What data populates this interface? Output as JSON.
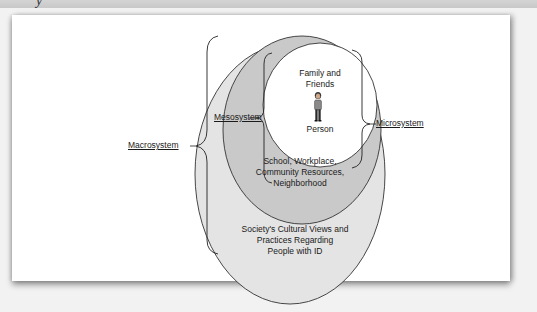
{
  "header": {
    "partial_char": "y"
  },
  "diagram": {
    "title": "",
    "layers": {
      "macro": {
        "label": "Macrosystem",
        "description": "Society's Cultural Views and Practices Regarding People with ID",
        "line1": "Society's Cultural Views and",
        "line2": "Practices Regarding",
        "line3": "People with ID",
        "fill": "#e4e4e4"
      },
      "meso": {
        "label": "Mesosystem",
        "description": "School, Workplace, Community Resources, Neighborhood",
        "line1": "School, Workplace,",
        "line2": "Community Resources,",
        "line3": "Neighborhood",
        "fill": "#c9c9c9"
      },
      "micro": {
        "label": "Microsystem",
        "line1": "Family and",
        "line2": "Friends",
        "fill": "#ffffff"
      },
      "center": {
        "label": "Person",
        "icon": "person-icon"
      }
    }
  }
}
